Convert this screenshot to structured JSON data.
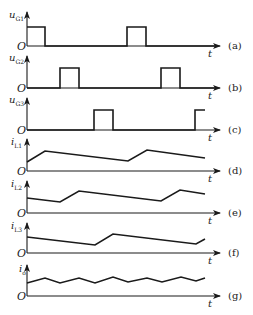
{
  "figure": {
    "origin_label": "O",
    "time_label": "t",
    "panels": [
      {
        "id": "a",
        "ylabel": "u",
        "ysub": "G1",
        "caption": "(a)",
        "type": "pulse"
      },
      {
        "id": "b",
        "ylabel": "u",
        "ysub": "G2",
        "caption": "(b)",
        "type": "pulse"
      },
      {
        "id": "c",
        "ylabel": "u",
        "ysub": "G3",
        "caption": "(c)",
        "type": "pulse"
      },
      {
        "id": "d",
        "ylabel": "i",
        "ysub": "L1",
        "caption": "(d)",
        "type": "current"
      },
      {
        "id": "e",
        "ylabel": "i",
        "ysub": "L2",
        "caption": "(e)",
        "type": "current"
      },
      {
        "id": "f",
        "ylabel": "i",
        "ysub": "L3",
        "caption": "(f)",
        "type": "current"
      },
      {
        "id": "g",
        "ylabel": "i",
        "ysub": "o",
        "caption": "(g)",
        "type": "current"
      }
    ],
    "colors": {
      "line": "#1a1a1a",
      "background": "#ffffff"
    }
  }
}
